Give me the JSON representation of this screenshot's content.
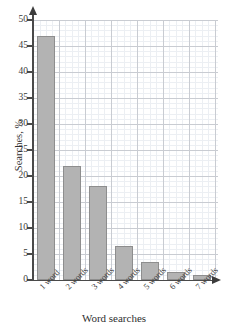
{
  "chart_data": {
    "type": "bar",
    "title": "",
    "subtitle": "",
    "xlabel": "Word searches",
    "ylabel": "Searches, %",
    "categories": [
      "1 word",
      "2 words",
      "3 words",
      "4 words",
      "5 words",
      "6 words",
      "7 words"
    ],
    "values": [
      47,
      22,
      18,
      6.5,
      3.5,
      1.5,
      1
    ],
    "ylim": [
      0,
      50
    ],
    "ytick_labels": [
      "0",
      "5",
      "10",
      "15",
      "20",
      "25",
      "30",
      "35",
      "40",
      "45",
      "50"
    ],
    "ytick_values": [
      0,
      5,
      10,
      15,
      20,
      25,
      30,
      35,
      40,
      45,
      50
    ],
    "grid": true,
    "grid_style": "graph-paper major and minor gridlines",
    "legend": "none",
    "bar_color": "#b3b3b3",
    "bar_border_color": "#8e8e8e",
    "axis_color": "#4a4a4a",
    "grid_major_color": "#c9ccd2",
    "grid_minor_color": "#eceff3",
    "xtick_label_rotation": -45
  }
}
